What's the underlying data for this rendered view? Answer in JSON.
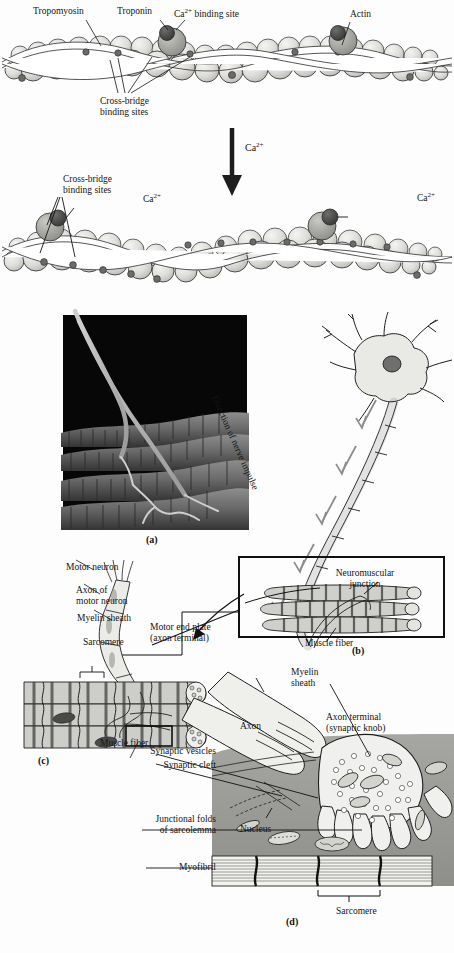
{
  "figure": {
    "background_color": "#fdfdfd",
    "ink_color": "#141414"
  },
  "filament_top": {
    "labels": {
      "tropomyosin": "Tropomyosin",
      "troponin": "Troponin",
      "ca_binding_site": "Ca2+ binding site",
      "ca_binding_site_base": "Ca",
      "ca_binding_site_sup": "2+",
      "ca_binding_site_rest": " binding site",
      "actin": "Actin",
      "cross_bridge": "Cross-bridge\nbinding sites"
    },
    "colors": {
      "actin_sphere": "#dddcd8",
      "actin_sphere_edge": "#2a2a2a",
      "troponin": "#9a9a96",
      "ca_site": "#4a4a48",
      "tropomyosin_strand": "#ffffff"
    }
  },
  "transition_arrow": {
    "label_base": "Ca",
    "label_sup": "2+",
    "label": "Ca2+",
    "color": "#1d1d1d"
  },
  "filament_bottom": {
    "labels": {
      "cross_bridge": "Cross-bridge\nbinding sites",
      "ca_left": "Ca2+",
      "ca_right": "Ca2+",
      "ca_base": "Ca",
      "ca_sup": "2+"
    }
  },
  "panel_a": {
    "letter": "(a)",
    "caption": "",
    "description": "scanning electron micrograph of motor neuron branches on muscle fibers",
    "background": "#0a0a0a",
    "fiber_color": "#6e6e6e"
  },
  "panel_b": {
    "letter": "(b)",
    "labels": {
      "direction": "Direction of nerve impulse",
      "nmj": "Neuromuscular\njunction",
      "nmj_line1": "Neuromuscular",
      "nmj_line2": "junction",
      "muscle_fiber": "Muscle fiber"
    }
  },
  "panel_c": {
    "letter": "(c)",
    "labels": {
      "motor_neuron": "Motor neuron",
      "axon_of_motor_neuron": "Axon of\nmotor neuron",
      "axon_line1": "Axon of",
      "axon_line2": "motor neuron",
      "myelin_sheath": "Myelin sheath",
      "sarcomere": "Sarcomere",
      "motor_end_plate": "Motor end plate\n(axon terminal)",
      "motor_end_plate_line1": "Motor end plate",
      "motor_end_plate_line2": "(axon terminal)",
      "muscle_fiber": "Muscle fiber"
    }
  },
  "panel_d": {
    "letter": "(d)",
    "labels": {
      "myelin_sheath": "Myelin\nsheath",
      "myelin_line1": "Myelin",
      "myelin_line2": "sheath",
      "axon": "Axon",
      "axon_terminal": "Axon terminal\n(synaptic knob)",
      "axon_terminal_line1": "Axon terminal",
      "axon_terminal_line2": "(synaptic knob)",
      "synaptic_vesicles": "Synaptic vesicles",
      "synaptic_cleft": "Synaptic cleft",
      "nucleus": "Nucleus",
      "junctional_folds": "Junctional folds\nof sarcolemma",
      "junctional_line1": "Junctional folds",
      "junctional_line2": "of sarcolemma",
      "myofibril": "Myofibril",
      "sarcomere": "Sarcomere"
    },
    "colors": {
      "sarcoplasm": "#9a9a96",
      "terminal_fill": "#ededea",
      "mitochondria": "#c9c9c4"
    }
  }
}
